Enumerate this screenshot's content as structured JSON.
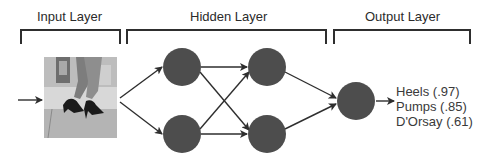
{
  "layers": {
    "input": {
      "title": "Input Layer"
    },
    "hidden": {
      "title": "Hidden Layer"
    },
    "output": {
      "title": "Output Layer"
    }
  },
  "image": {
    "description": "photo of legs walking in black high heels"
  },
  "predictions": [
    {
      "label": "Heels (.97)"
    },
    {
      "label": "Pumps (.85)"
    },
    {
      "label": "D'Orsay (.61)"
    }
  ],
  "colors": {
    "node": "#4d4d4d",
    "line": "#2e2e2e",
    "text": "#2b2b2b"
  }
}
